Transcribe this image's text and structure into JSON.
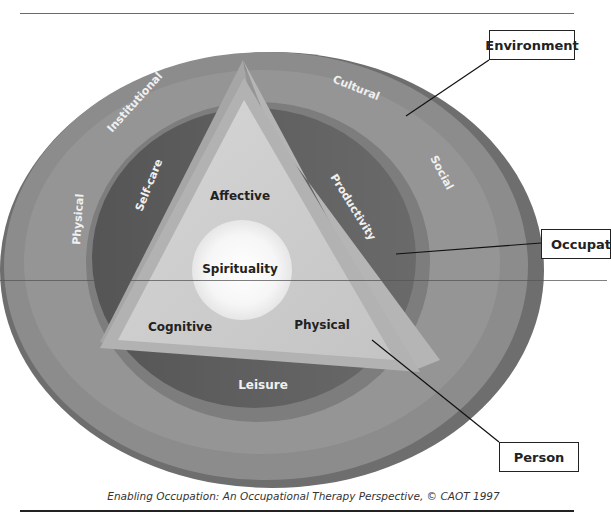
{
  "diagram": {
    "type": "conceptual-model",
    "layers": {
      "environment": {
        "callout": "Environment",
        "segments": [
          "Institutional",
          "Cultural",
          "Social",
          "Physical"
        ]
      },
      "occupation": {
        "callout": "Occupat",
        "segments": [
          "Self-care",
          "Productivity",
          "Leisure"
        ]
      },
      "person": {
        "callout": "Person",
        "segments": [
          "Affective",
          "Cognitive",
          "Physical"
        ],
        "core": "Spirituality"
      }
    },
    "caption": "Enabling Occupation:  An Occupational Therapy Perspective, © CAOT 1997"
  },
  "colors": {
    "outer_ring": "#8a8a8a",
    "outer_ring_edge": "#6f6f6f",
    "middle_ring": "#9a9a9a",
    "occupation_band": "#5e5e5e",
    "triangle": "#cfcfcf",
    "triangle_edge": "#a9a9a9",
    "core": "#f5f5f5"
  }
}
